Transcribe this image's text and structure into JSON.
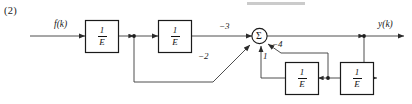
{
  "figure": {
    "problem_number": "(2)",
    "type": "signal-flow-block-diagram"
  },
  "signals": {
    "input_label": "f(k)",
    "output_label": "y(k)"
  },
  "blocks": {
    "forward_1": {
      "numerator": "1",
      "denominator": "E"
    },
    "forward_2": {
      "numerator": "1",
      "denominator": "E"
    },
    "feedback_1": {
      "numerator": "1",
      "denominator": "E"
    },
    "feedback_2": {
      "numerator": "1",
      "denominator": "E"
    }
  },
  "summing_junction": {
    "symbol": "Σ"
  },
  "gains": {
    "forward_path": "−3",
    "input_feedforward": "−2",
    "feedback_inner": "1",
    "feedback_outer": "−4"
  },
  "colors": {
    "line": "#3a3a3a",
    "block_border": "#1a1a1a",
    "text": "#1a1a1a",
    "background": "#ffffff"
  }
}
